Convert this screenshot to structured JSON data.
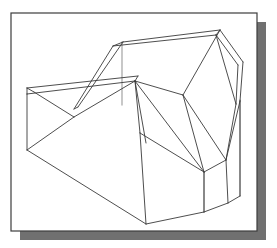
{
  "figure": {
    "kind": "technical-line-drawing",
    "canvas": {
      "width": 277,
      "height": 248
    },
    "colors": {
      "page_background": "#ffffff",
      "frame_fill": "#ffffff",
      "frame_border": "#3c3c3c",
      "drop_shadow": "#707070",
      "object_line": "#3a3a3a",
      "hidden_or_light_line": "#b0b0b0"
    },
    "frame": {
      "name": "picture-frame",
      "x": 11,
      "y": 13,
      "width": 246,
      "height": 218,
      "border_width": 1.2,
      "shadow_offset_x": 9,
      "shadow_offset_y": 9
    },
    "line_widths": {
      "object": 0.9,
      "light": 1.4
    },
    "vertices": {
      "ridge_left": [
        123,
        42
      ],
      "ridge_right": [
        220,
        30
      ],
      "ridge_left_under": [
        123,
        47
      ],
      "ridge_right_under": [
        220,
        35
      ],
      "ridge_left_front": [
        113,
        45
      ],
      "gable_right_out": [
        243,
        62
      ],
      "gable_right_in": [
        236,
        66
      ],
      "right_upper": [
        240,
        101
      ],
      "right_mid": [
        236,
        104
      ],
      "eave_far_left": [
        27,
        88
      ],
      "eave_front_left": [
        27,
        94
      ],
      "eave_far_right": [
        138,
        76
      ],
      "eave_front_right": [
        135,
        80
      ],
      "notch_bottom": [
        74,
        117
      ],
      "notch_right": [
        107,
        112
      ],
      "left_base_top": [
        27,
        88
      ],
      "left_base_bottom": [
        27,
        150
      ],
      "bottom_front": [
        146,
        224
      ],
      "bottom_left_turn": [
        27,
        150
      ],
      "fan_apex": [
        135,
        80
      ],
      "fan_hub": [
        204,
        172
      ],
      "mid_step_left": [
        140,
        133
      ],
      "mid_step_bottom": [
        146,
        224
      ],
      "step_right": [
        204,
        172
      ],
      "right_col_top": [
        226,
        160
      ],
      "right_col_bottom": [
        228,
        203
      ],
      "right_base_corner": [
        205,
        215
      ],
      "right_outer_top": [
        243,
        62
      ],
      "right_outer_low": [
        240,
        160
      ]
    },
    "description_of_edges": [
      "roof ridge top-left to top-right",
      "roof ridge thickness line below ridge",
      "left sloping roof plane down to eave",
      "right gable face triangle",
      "horizontal eave pair across the middle",
      "V-shaped notch cut into the left shelf",
      "long base edge sloping down-right from left vertical edge",
      "fan of four radiating edges from the center apex to the lower hub",
      "vertical faces of the central and right blocks",
      "lower stepped base outline"
    ]
  }
}
